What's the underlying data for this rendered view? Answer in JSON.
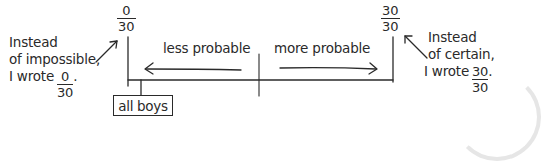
{
  "diagram": {
    "type": "probability-line",
    "left_end": {
      "numerator": "0",
      "denominator": "30"
    },
    "right_end": {
      "numerator": "30",
      "denominator": "30"
    },
    "left_direction_label": "less probable",
    "right_direction_label": "more probable",
    "marker_box_label": "all boys",
    "left_note": {
      "line1": "Instead",
      "line2": "of impossible,",
      "line3_prefix": "I wrote",
      "fraction": {
        "numerator": "0",
        "denominator": "30"
      },
      "suffix": "."
    },
    "right_note": {
      "line1": "Instead",
      "line2": "of certain,",
      "line3_prefix": "I wrote",
      "fraction": {
        "numerator": "30",
        "denominator": "30"
      },
      "suffix": "."
    },
    "line_color": "#2a2a2a"
  }
}
